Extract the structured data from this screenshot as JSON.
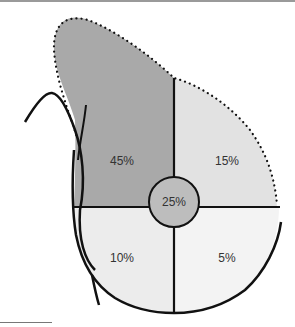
{
  "diagram": {
    "type": "breast-quadrant-diagram",
    "colors": {
      "upper_outer": "#a9a9a9",
      "upper_inner": "#e2e2e2",
      "lower_outer": "#ececec",
      "lower_inner": "#f3f3f3",
      "central": "#bdbdbd",
      "outline": "#111111"
    },
    "regions": [
      {
        "id": "upper-outer",
        "label": "45%"
      },
      {
        "id": "upper-inner",
        "label": "15%"
      },
      {
        "id": "central",
        "label": "25%"
      },
      {
        "id": "lower-outer",
        "label": "10%"
      },
      {
        "id": "lower-inner",
        "label": "5%"
      }
    ]
  }
}
